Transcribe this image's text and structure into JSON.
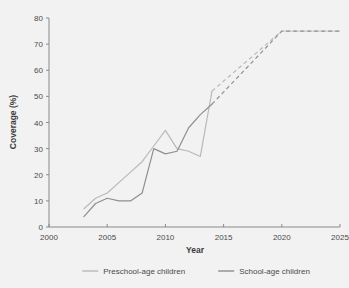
{
  "top_fragment": "",
  "chart_data": {
    "type": "line",
    "title": "",
    "xlabel": "Year",
    "ylabel": "Coverage (%)",
    "xlim": [
      2000,
      2025
    ],
    "ylim": [
      0,
      80
    ],
    "xticks": [
      2000,
      2005,
      2010,
      2015,
      2020,
      2025
    ],
    "yticks": [
      0,
      10,
      20,
      30,
      40,
      50,
      60,
      70,
      80
    ],
    "grid": false,
    "legend_position": "bottom",
    "colors": {
      "preschool": "#b9b9b9",
      "school": "#8f8f8f",
      "axis": "#8a8a8a",
      "text": "#4a4a4a",
      "background": "#f2f2f2"
    },
    "series": [
      {
        "name": "Preschool-age children",
        "color": "#b9b9b9",
        "style": "solid",
        "x": [
          2003,
          2004,
          2005,
          2006,
          2007,
          2008,
          2009,
          2010,
          2011,
          2012,
          2013,
          2014
        ],
        "values": [
          7,
          11,
          13,
          17,
          21,
          25,
          31,
          37,
          30,
          29,
          27,
          52
        ]
      },
      {
        "name": "Preschool-age children (projection)",
        "color": "#b9b9b9",
        "style": "dashed",
        "x": [
          2014,
          2020,
          2025
        ],
        "values": [
          52,
          75,
          75
        ]
      },
      {
        "name": "School-age children",
        "color": "#8f8f8f",
        "style": "solid",
        "x": [
          2003,
          2004,
          2005,
          2006,
          2007,
          2008,
          2009,
          2010,
          2011,
          2012,
          2013,
          2014
        ],
        "values": [
          4,
          9,
          11,
          10,
          10,
          13,
          30,
          28,
          29,
          38,
          43,
          47
        ]
      },
      {
        "name": "School-age children (projection)",
        "color": "#8f8f8f",
        "style": "dashed",
        "x": [
          2014,
          2020,
          2025
        ],
        "values": [
          47,
          75,
          75
        ]
      }
    ],
    "legend": [
      {
        "label": "Preschool-age children",
        "color": "#b9b9b9"
      },
      {
        "label": "School-age children",
        "color": "#8f8f8f"
      }
    ]
  }
}
